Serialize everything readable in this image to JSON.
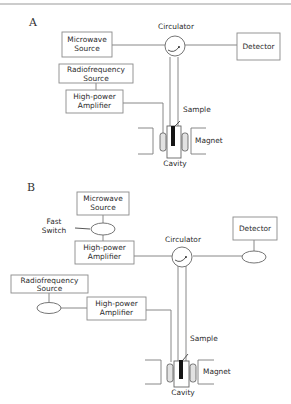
{
  "figure": {
    "panels": [
      {
        "label": "A",
        "components": {
          "microwave_source": [
            "Microwave",
            "Source"
          ],
          "circulator": "Circulator",
          "detector": "Detector",
          "rf_source": [
            "Radiofrequency",
            "Source"
          ],
          "amplifier": [
            "High-power",
            "Amplifier"
          ],
          "sample": "Sample",
          "magnet": "Magnet",
          "cavity": "Cavity"
        }
      },
      {
        "label": "B",
        "components": {
          "microwave_source": [
            "Microwave",
            "Source"
          ],
          "fast_switch": [
            "Fast",
            "Switch"
          ],
          "amplifier_mw": [
            "High-power",
            "Amplifier"
          ],
          "circulator": "Circulator",
          "detector": "Detector",
          "rf_source": [
            "Radiofrequency",
            "Source"
          ],
          "amplifier_rf": [
            "High-power",
            "Amplifier"
          ],
          "sample": "Sample",
          "magnet": "Magnet",
          "cavity": "Cavity"
        }
      }
    ]
  },
  "colors": {
    "line": "#7a7a7a",
    "text": "#2b2b2b",
    "sample": "#151515"
  }
}
